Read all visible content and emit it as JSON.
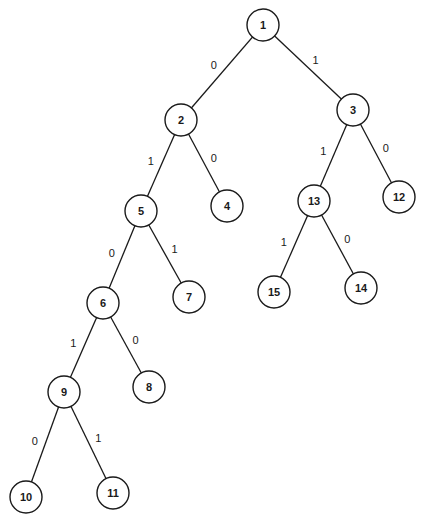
{
  "diagram": {
    "type": "binary-tree",
    "node_radius": 16,
    "colors": {
      "stroke": "#1a1a1a",
      "fill": "#ffffff",
      "background": "#ffffff"
    },
    "nodes": [
      {
        "id": "1",
        "label": "1",
        "x": 263,
        "y": 25
      },
      {
        "id": "2",
        "label": "2",
        "x": 181,
        "y": 120
      },
      {
        "id": "3",
        "label": "3",
        "x": 353,
        "y": 110
      },
      {
        "id": "4",
        "label": "4",
        "x": 227,
        "y": 206
      },
      {
        "id": "5",
        "label": "5",
        "x": 141,
        "y": 211
      },
      {
        "id": "6",
        "label": "6",
        "x": 103,
        "y": 303
      },
      {
        "id": "7",
        "label": "7",
        "x": 189,
        "y": 297
      },
      {
        "id": "8",
        "label": "8",
        "x": 149,
        "y": 387
      },
      {
        "id": "9",
        "label": "9",
        "x": 64,
        "y": 392
      },
      {
        "id": "10",
        "label": "10",
        "x": 26,
        "y": 497
      },
      {
        "id": "11",
        "label": "11",
        "x": 113,
        "y": 493
      },
      {
        "id": "12",
        "label": "12",
        "x": 399,
        "y": 197
      },
      {
        "id": "13",
        "label": "13",
        "x": 314,
        "y": 201
      },
      {
        "id": "14",
        "label": "14",
        "x": 361,
        "y": 288
      },
      {
        "id": "15",
        "label": "15",
        "x": 274,
        "y": 292
      }
    ],
    "edges": [
      {
        "from": "1",
        "to": "2",
        "label": "0"
      },
      {
        "from": "1",
        "to": "3",
        "label": "1"
      },
      {
        "from": "2",
        "to": "5",
        "label": "1"
      },
      {
        "from": "2",
        "to": "4",
        "label": "0"
      },
      {
        "from": "3",
        "to": "13",
        "label": "1"
      },
      {
        "from": "3",
        "to": "12",
        "label": "0"
      },
      {
        "from": "5",
        "to": "6",
        "label": "0"
      },
      {
        "from": "5",
        "to": "7",
        "label": "1"
      },
      {
        "from": "13",
        "to": "15",
        "label": "1"
      },
      {
        "from": "13",
        "to": "14",
        "label": "0"
      },
      {
        "from": "6",
        "to": "9",
        "label": "1"
      },
      {
        "from": "6",
        "to": "8",
        "label": "0"
      },
      {
        "from": "9",
        "to": "10",
        "label": "0"
      },
      {
        "from": "9",
        "to": "11",
        "label": "1"
      }
    ]
  }
}
